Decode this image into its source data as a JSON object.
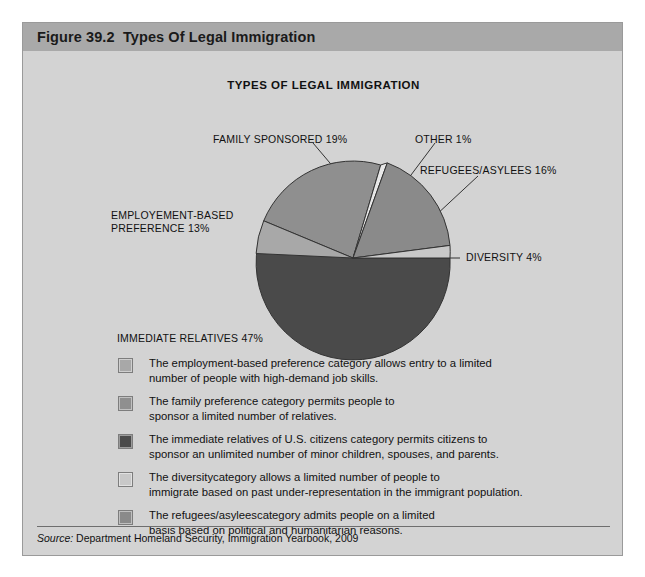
{
  "figure": {
    "header_label": "Figure 39.2  Types Of Legal Immigration",
    "chart_title": "TYPES OF LEGAL IMMIGRATION",
    "source_prefix": "Source:",
    "source_text": " Department Homeland Security, Immigration Yearbook, 2009"
  },
  "colors": {
    "page_background": "#ffffff",
    "panel_background": "#d3d3d3",
    "header_background": "#a9a9a9",
    "slice_family_sponsored": "#8f8f8f",
    "slice_employment_based": "#a8a8a8",
    "slice_immediate_relatives": "#4a4a4a",
    "slice_diversity": "#c8c8c8",
    "slice_refugees": "#8a8a8a",
    "slice_other": "#e8e8e8",
    "outline": "#333333"
  },
  "chart_data": {
    "type": "pie",
    "title": "TYPES OF LEGAL IMMIGRATION",
    "xlabel": "",
    "ylabel": "",
    "legend_position": "below",
    "categories": [
      "FAMILY SPONSORED",
      "EMPLOYEMENT-BASED PREFERENCE",
      "IMMEDIATE RELATIVES",
      "DIVERSITY",
      "REFUGEES/ASYLEES",
      "OTHER"
    ],
    "values": [
      19,
      13,
      47,
      4,
      16,
      1
    ],
    "units": "percent",
    "slices": [
      {
        "label": "FAMILY SPONSORED 19%",
        "name": "FAMILY SPONSORED",
        "value": 19,
        "color": "#8f8f8f"
      },
      {
        "label": "EMPLOYEMENT-BASED\nPREFERENCE 13%",
        "name": "EMPLOYEMENT-BASED PREFERENCE",
        "value": 13,
        "color": "#a8a8a8"
      },
      {
        "label": "IMMEDIATE RELATIVES 47%",
        "name": "IMMEDIATE RELATIVES",
        "value": 47,
        "color": "#4a4a4a"
      },
      {
        "label": "DIVERSITY 4%",
        "name": "DIVERSITY",
        "value": 4,
        "color": "#c8c8c8"
      },
      {
        "label": "REFUGEES/ASYLEES 16%",
        "name": "REFUGEES/ASYLEES",
        "value": 16,
        "color": "#8a8a8a"
      },
      {
        "label": "OTHER 1%",
        "name": "OTHER",
        "value": 1,
        "color": "#e8e8e8"
      }
    ]
  },
  "callouts": {
    "family_sponsored": "FAMILY SPONSORED 19%",
    "other": "OTHER 1%",
    "refugees": "REFUGEES/ASYLEES 16%",
    "employment_line1": "EMPLOYEMENT-BASED",
    "employment_line2": "PREFERENCE 13%",
    "diversity": "DIVERSITY 4%",
    "immediate_relatives": "IMMEDIATE RELATIVES 47%"
  },
  "legend": {
    "items": [
      {
        "swatch_color": "#a8a8a8",
        "text": "The employment-based preference category allows entry to a limited\nnumber of people with high-demand job skills."
      },
      {
        "swatch_color": "#8f8f8f",
        "text": "The family preference category permits people to\nsponsor a limited number of relatives."
      },
      {
        "swatch_color": "#4a4a4a",
        "text": "The immediate relatives of U.S. citizens category permits citizens to\nsponsor an unlimited number of minor children, spouses, and parents."
      },
      {
        "swatch_color": "#c8c8c8",
        "text": "The diversitycategory allows a limited number of people to\nimmigrate based on past under-representation in the immigrant population."
      },
      {
        "swatch_color": "#8a8a8a",
        "text": "The refugees/asyleescategory admits people on a limited\n basis based on political and humanitarian reasons."
      }
    ]
  }
}
